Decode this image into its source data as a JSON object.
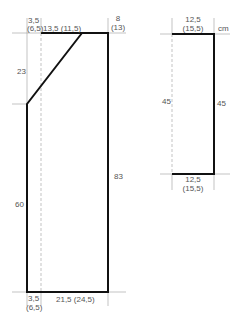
{
  "diagram": {
    "unit": "cm",
    "colors": {
      "outline": "#111111",
      "guide": "#aaaaaa",
      "text": "#555555"
    },
    "body_piece": {
      "top_left_width": {
        "line1": "3,5",
        "line2": "(6,5)"
      },
      "neck_width": "13,5 (11,5)",
      "shoulder_width": {
        "line1": "8",
        "line2": "(13)"
      },
      "neck_depth": "23",
      "lower_height": "60",
      "total_height": "83",
      "bottom_left_width": {
        "line1": "3,5",
        "line2": "(6,5)"
      },
      "bottom_width": "21,5 (24,5)"
    },
    "sleeve_piece": {
      "top_width": {
        "line1": "12,5",
        "line2": "(15,5)"
      },
      "left_height": "45",
      "right_height": "45",
      "bottom_width": {
        "line1": "12,5",
        "line2": "(15,5)"
      }
    }
  }
}
